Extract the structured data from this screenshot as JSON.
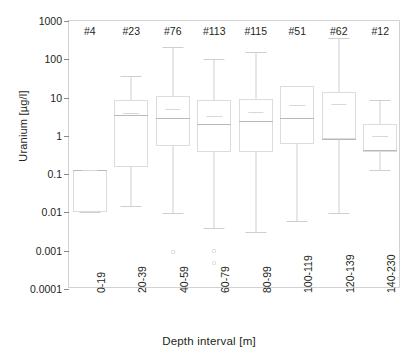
{
  "chart_data": {
    "type": "box",
    "title": "",
    "xlabel": "Depth interval [m]",
    "ylabel": "Uranium [µg/l]",
    "yscale": "log",
    "ylim": [
      0.0001,
      1000
    ],
    "ytick_labels": [
      "1000",
      "100",
      "10",
      "1",
      "0.1",
      "0.01",
      "0.001",
      "0.0001"
    ],
    "ytick_values": [
      1000,
      100,
      10,
      1,
      0.1,
      0.01,
      0.001,
      0.0001
    ],
    "grid": false,
    "legend": "none",
    "categories": [
      "0-19",
      "20-39",
      "40-59",
      "60-79",
      "80-99",
      "100-119",
      "120-139",
      "140-230"
    ],
    "count_labels": [
      "#4",
      "#23",
      "#76",
      "#113",
      "#115",
      "#51",
      "#62",
      "#12"
    ],
    "counts": [
      4,
      23,
      76,
      113,
      115,
      51,
      62,
      12
    ],
    "boxes": [
      {
        "category": "0-19",
        "count_label": "#4",
        "whisker_high": 0.13,
        "q3": 0.13,
        "median": 0.13,
        "mean": 0.13,
        "q1": 0.01,
        "whisker_low": 0.01,
        "outliers": []
      },
      {
        "category": "20-39",
        "count_label": "#23",
        "whisker_high": 36,
        "q3": 8.5,
        "median": 3.6,
        "mean": 4.0,
        "q1": 0.15,
        "whisker_low": 0.015,
        "outliers": []
      },
      {
        "category": "40-59",
        "count_label": "#76",
        "whisker_high": 210,
        "q3": 11,
        "median": 2.9,
        "mean": 5.0,
        "q1": 0.55,
        "whisker_low": 0.0095,
        "outliers": [
          0.00095
        ]
      },
      {
        "category": "60-79",
        "count_label": "#113",
        "whisker_high": 100,
        "q3": 8.5,
        "median": 2.0,
        "mean": 3.3,
        "q1": 0.38,
        "whisker_low": 0.004,
        "outliers": [
          0.00098,
          0.00048
        ]
      },
      {
        "category": "80-99",
        "count_label": "#115",
        "whisker_high": 155,
        "q3": 9.0,
        "median": 2.4,
        "mean": 4.2,
        "q1": 0.38,
        "whisker_low": 0.003,
        "outliers": []
      },
      {
        "category": "100-119",
        "count_label": "#51",
        "whisker_high": 20,
        "q3": 20,
        "median": 2.9,
        "mean": 6.5,
        "q1": 0.6,
        "whisker_low": 0.0058,
        "outliers": []
      },
      {
        "category": "120-139",
        "count_label": "#62",
        "whisker_high": 350,
        "q3": 14,
        "median": 0.85,
        "mean": 6.8,
        "q1": 0.85,
        "whisker_low": 0.0098,
        "outliers": []
      },
      {
        "category": "140-230",
        "count_label": "#12",
        "whisker_high": 8.5,
        "q3": 2.1,
        "median": 0.42,
        "mean": 1.0,
        "q1": 0.38,
        "whisker_low": 0.13,
        "outliers": []
      }
    ]
  }
}
